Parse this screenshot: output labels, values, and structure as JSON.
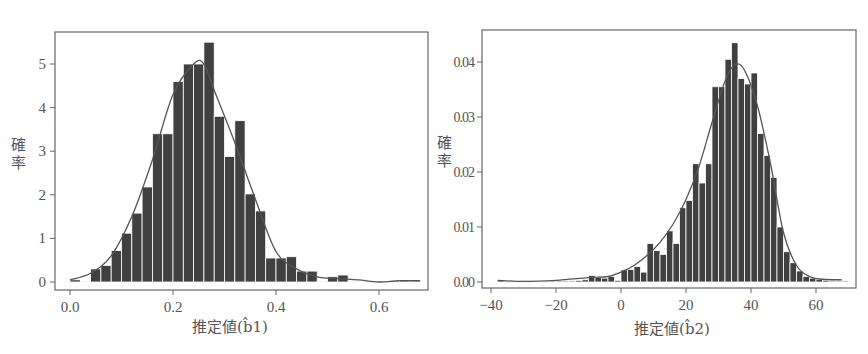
{
  "chart_data": [
    {
      "type": "bar",
      "subtype": "histogram_with_density_curve",
      "title": "",
      "xlabel": "推定値(b̂1)",
      "ylabel": "確率",
      "xlim": [
        -0.03,
        0.69
      ],
      "ylim": [
        -0.15,
        5.75
      ],
      "xticks": [
        "0.0",
        "0.2",
        "0.4",
        "0.6"
      ],
      "xtick_values": [
        0.0,
        0.2,
        0.4,
        0.6
      ],
      "yticks": [
        "0",
        "1",
        "2",
        "3",
        "4",
        "5"
      ],
      "ytick_values": [
        0,
        1,
        2,
        3,
        4,
        5
      ],
      "grid": false,
      "legend": null,
      "bin_width": 0.02,
      "bins": [
        0.0,
        0.02,
        0.04,
        0.06,
        0.08,
        0.1,
        0.12,
        0.14,
        0.16,
        0.18,
        0.2,
        0.22,
        0.24,
        0.26,
        0.28,
        0.3,
        0.32,
        0.34,
        0.36,
        0.38,
        0.4,
        0.42,
        0.44,
        0.46,
        0.48,
        0.5,
        0.52,
        0.54,
        0.56,
        0.58,
        0.6,
        0.62,
        0.64,
        0.66
      ],
      "values": [
        0.05,
        0.02,
        0.3,
        0.38,
        0.72,
        1.12,
        1.58,
        2.18,
        3.4,
        3.4,
        4.6,
        5.0,
        5.0,
        5.5,
        3.8,
        2.88,
        3.7,
        2.02,
        1.63,
        0.55,
        0.55,
        0.58,
        0.25,
        0.25,
        0.02,
        0.12,
        0.16,
        0.02,
        0.0,
        0.0,
        0.0,
        0.03,
        0.03,
        0.03
      ],
      "density_curve": {
        "x": [
          0.0,
          0.04,
          0.08,
          0.12,
          0.16,
          0.2,
          0.24,
          0.26,
          0.28,
          0.32,
          0.36,
          0.4,
          0.44,
          0.48,
          0.52,
          0.56,
          0.6,
          0.64,
          0.68
        ],
        "y": [
          0.05,
          0.2,
          0.6,
          1.5,
          2.8,
          4.3,
          5.0,
          5.0,
          4.4,
          3.2,
          1.9,
          0.7,
          0.3,
          0.12,
          0.08,
          0.05,
          0.0,
          0.03,
          0.03
        ]
      }
    },
    {
      "type": "bar",
      "subtype": "histogram_with_density_curve",
      "title": "",
      "xlabel": "推定値(b̂2)",
      "ylabel": "確率",
      "xlim": [
        -43,
        72
      ],
      "ylim": [
        -0.0012,
        0.0455
      ],
      "xticks": [
        "−40",
        "−20",
        "0",
        "20",
        "40",
        "60"
      ],
      "xtick_values": [
        -40,
        -20,
        0,
        20,
        40,
        60
      ],
      "yticks": [
        "0.00",
        "0.01",
        "0.02",
        "0.03",
        "0.04"
      ],
      "ytick_values": [
        0.0,
        0.01,
        0.02,
        0.03,
        0.04
      ],
      "grid": false,
      "legend": null,
      "bin_width": 2,
      "bins": [
        -38,
        -36,
        -34,
        -32,
        -30,
        -28,
        -26,
        -24,
        -22,
        -20,
        -18,
        -16,
        -14,
        -12,
        -10,
        -8,
        -6,
        -4,
        -2,
        0,
        2,
        4,
        6,
        8,
        10,
        12,
        14,
        16,
        18,
        20,
        22,
        24,
        26,
        28,
        30,
        32,
        34,
        36,
        38,
        40,
        42,
        44,
        46,
        48,
        50,
        52,
        54,
        56,
        58,
        60,
        62,
        64,
        66,
        68
      ],
      "values": [
        0.0003,
        0.0001,
        0.0,
        0.0,
        0.0,
        0.0,
        0.0,
        0.0001,
        0.0002,
        0.0002,
        0.0002,
        0.0002,
        0.0003,
        0.0004,
        0.0012,
        0.0008,
        0.0007,
        0.001,
        0.0003,
        0.0022,
        0.0023,
        0.0028,
        0.0018,
        0.007,
        0.0057,
        0.005,
        0.0093,
        0.007,
        0.0135,
        0.0148,
        0.0215,
        0.018,
        0.0215,
        0.0355,
        0.0355,
        0.0405,
        0.0435,
        0.037,
        0.036,
        0.038,
        0.027,
        0.023,
        0.019,
        0.01,
        0.0055,
        0.0035,
        0.002,
        0.001,
        0.0007,
        0.0005,
        0.0003,
        0.0002,
        0.0002,
        0.0002
      ],
      "density_curve": {
        "x": [
          -38,
          -30,
          -20,
          -10,
          -4,
          0,
          4,
          8,
          12,
          16,
          20,
          24,
          28,
          32,
          35,
          38,
          42,
          46,
          50,
          54,
          58,
          62,
          68
        ],
        "y": [
          0.0003,
          0.0001,
          0.0003,
          0.0008,
          0.001,
          0.0018,
          0.003,
          0.0048,
          0.0072,
          0.0105,
          0.015,
          0.021,
          0.029,
          0.0365,
          0.0395,
          0.0385,
          0.032,
          0.0215,
          0.009,
          0.003,
          0.001,
          0.0005,
          0.0004
        ]
      }
    }
  ]
}
